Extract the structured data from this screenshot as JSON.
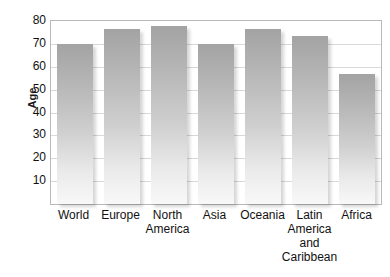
{
  "chart_data": {
    "type": "bar",
    "title": "",
    "xlabel": "",
    "ylabel": "Age",
    "ylim": [
      0,
      80
    ],
    "ytick_step": 10,
    "yticks": [
      80,
      70,
      60,
      50,
      40,
      30,
      20,
      10
    ],
    "grid": true,
    "legend": "none",
    "categories": [
      "World",
      "Europe",
      "North America",
      "Asia",
      "Oceania",
      "Latin America and Caribbean",
      "Africa"
    ],
    "category_label_lines": [
      [
        "World"
      ],
      [
        "Europe"
      ],
      [
        "North",
        "America"
      ],
      [
        "Asia"
      ],
      [
        "Oceania"
      ],
      [
        "Latin",
        "America",
        "and",
        "Caribbean"
      ],
      [
        "Africa"
      ]
    ],
    "values": [
      70,
      76.5,
      78,
      70,
      76.5,
      73.5,
      57
    ],
    "bar_color_top": "#a3a3a3",
    "bar_color_bottom": "#f8f8f8",
    "gridline_color": "#d8d8d8",
    "axis_color": "#b9b9b9",
    "text_color": "#111111"
  }
}
